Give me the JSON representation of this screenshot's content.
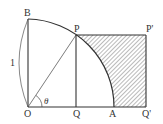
{
  "diagram": {
    "type": "geometry",
    "points": [
      {
        "id": "O",
        "label": "O",
        "x": 28,
        "y": 107
      },
      {
        "id": "B",
        "label": "B",
        "x": 28,
        "y": 19
      },
      {
        "id": "P",
        "label": "P",
        "x": 76,
        "y": 35
      },
      {
        "id": "Q",
        "label": "Q",
        "x": 76,
        "y": 107
      },
      {
        "id": "A",
        "label": "A",
        "x": 113,
        "y": 107
      },
      {
        "id": "Qp",
        "label": "Q'",
        "x": 146,
        "y": 107
      },
      {
        "id": "Pp",
        "label": "P'",
        "x": 146,
        "y": 35
      }
    ],
    "angle_label": "θ",
    "length_label": "1",
    "colors": {
      "stroke": "#333333",
      "hatch": "#555555",
      "background": "#ffffff"
    }
  }
}
